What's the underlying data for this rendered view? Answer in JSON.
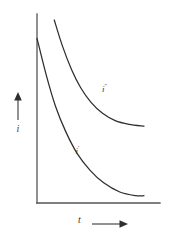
{
  "figure": {
    "background_color": "#ffffff",
    "ink_color": "#3a3a3a",
    "axis_color": "#555555",
    "width": 179,
    "height": 239
  },
  "axes": {
    "y_axis": {
      "label": "i",
      "arrow_direction": "up",
      "x": 37,
      "y_top": 14,
      "y_bottom": 203
    },
    "x_axis": {
      "label": "t",
      "arrow_direction": "right",
      "y": 203,
      "x_left": 37,
      "x_right": 160
    }
  },
  "labels": {
    "upper_curve_symbol": "i",
    "upper_curve_mark": "′′",
    "lower_curve_symbol": "i",
    "lower_curve_mark": "′"
  },
  "chart_data": {
    "type": "line",
    "title": "",
    "xlabel": "t",
    "ylabel": "i",
    "grid": false,
    "legend": "inline-curve-labels",
    "xlim": [
      0,
      1
    ],
    "ylim": [
      0,
      1
    ],
    "axis_ticks": {
      "x": [],
      "y": []
    },
    "series": [
      {
        "name": "i′′",
        "description": "upper decaying exponential curve, starts partway along axis and decays to a higher plateau",
        "x": [
          0.15,
          0.22,
          0.3,
          0.38,
          0.47,
          0.57,
          0.68,
          0.8,
          0.93
        ],
        "y": [
          1.0,
          0.86,
          0.73,
          0.63,
          0.55,
          0.49,
          0.45,
          0.43,
          0.42
        ],
        "label_position": {
          "x": 0.6,
          "y": 0.62
        }
      },
      {
        "name": "i′",
        "description": "lower decaying exponential curve, starts on the vertical axis and decays toward the horizontal axis",
        "x": [
          0.0,
          0.08,
          0.16,
          0.25,
          0.35,
          0.46,
          0.58,
          0.72,
          0.86,
          0.93
        ],
        "y": [
          0.9,
          0.7,
          0.53,
          0.39,
          0.27,
          0.18,
          0.11,
          0.06,
          0.04,
          0.04
        ],
        "label_position": {
          "x": 0.37,
          "y": 0.28
        }
      }
    ]
  }
}
